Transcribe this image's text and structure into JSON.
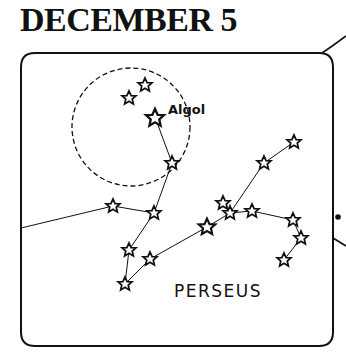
{
  "page": {
    "title": "DECEMBER 5",
    "constellation_label": "PERSEUS",
    "star_label": "Algol"
  },
  "colors": {
    "ink": "#111111",
    "background": "#ffffff"
  }
}
